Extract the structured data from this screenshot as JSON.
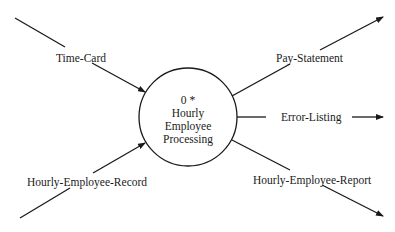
{
  "diagram": {
    "type": "context data flow diagram",
    "process": {
      "number": "0 *",
      "name_lines": [
        "Hourly",
        "Employee",
        "Processing"
      ]
    },
    "inputs": [
      {
        "label": "Time-Card"
      },
      {
        "label": "Hourly-Employee-Record"
      }
    ],
    "outputs": [
      {
        "label": "Pay-Statement"
      },
      {
        "label": "Error-Listing"
      },
      {
        "label": "Hourly-Employee-Report"
      }
    ],
    "colors": {
      "stroke": "#1a1a1a",
      "background": "#ffffff"
    }
  }
}
